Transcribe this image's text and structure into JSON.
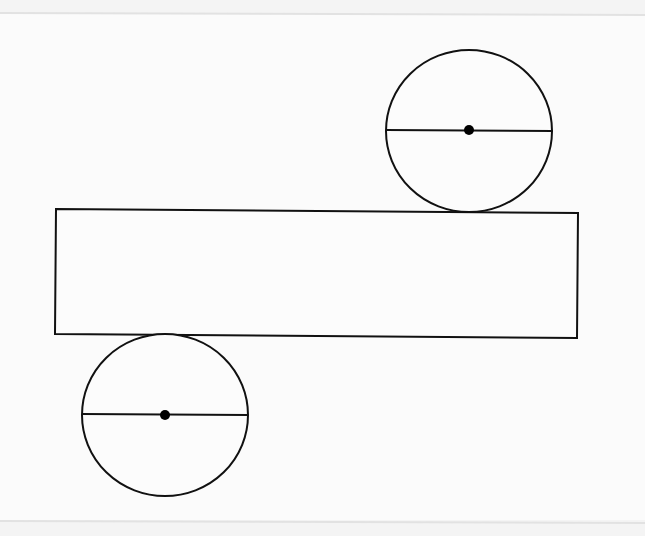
{
  "figure": {
    "background": "#f4f4f4",
    "paper_band": "#fbfbfb",
    "stroke_color": "#111111",
    "stroke_width": 2,
    "rectangle": {
      "points": [
        [
          56,
          209
        ],
        [
          578,
          213
        ],
        [
          577,
          338
        ],
        [
          55,
          334
        ]
      ],
      "label": "lateral-surface"
    },
    "circles": [
      {
        "name": "top-base",
        "cx": 469,
        "cy": 131,
        "rx": 83,
        "ry": 81,
        "diameter": {
          "x1": 386,
          "y1": 130,
          "x2": 553,
          "y2": 131
        },
        "center_dot": {
          "cx": 469,
          "cy": 130,
          "r": 5
        }
      },
      {
        "name": "bottom-base",
        "cx": 165,
        "cy": 415,
        "rx": 83,
        "ry": 81,
        "diameter": {
          "x1": 82,
          "y1": 414,
          "x2": 248,
          "y2": 415
        },
        "center_dot": {
          "cx": 165,
          "cy": 415,
          "r": 5
        }
      }
    ]
  }
}
